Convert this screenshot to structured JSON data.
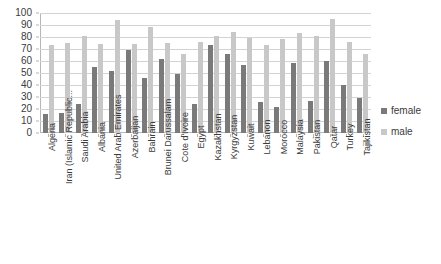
{
  "chart_data": {
    "type": "bar",
    "title": "",
    "subtitle": "",
    "xlabel": "",
    "ylabel": "",
    "ylim": [
      0,
      100
    ],
    "ytick_step": 10,
    "yticks": [
      100,
      90,
      80,
      70,
      60,
      50,
      40,
      30,
      20,
      10,
      0
    ],
    "grid": true,
    "legend_position": "right",
    "categories": [
      "Algeria",
      "Iran (Islamic Republic...",
      "Saudi Arabia",
      "Albania",
      "United Arab Emirates",
      "Azerbaijan",
      "Bahrain",
      "Brunei Darussalam",
      "Cote d'Ivoire",
      "Egypt",
      "Kazakhstan",
      "Kyrgyzstan",
      "Kuwait",
      "Lebanon",
      "Morocco",
      "Malaysia",
      "Pakistan",
      "Qatar",
      "Turkey",
      "Tajikistan"
    ],
    "series": [
      {
        "name": "female",
        "color": "#7a7a7a",
        "values": [
          16,
          17,
          24,
          55,
          52,
          69,
          46,
          62,
          49,
          24,
          73,
          66,
          57,
          26,
          22,
          58,
          27,
          60,
          40,
          29
        ]
      },
      {
        "name": "male",
        "color": "#c8c8c8",
        "values": [
          73,
          75,
          81,
          74,
          94,
          74,
          88,
          75,
          66,
          76,
          81,
          84,
          79,
          73,
          78,
          83,
          81,
          95,
          76,
          66
        ]
      }
    ]
  },
  "legend": {
    "items": [
      {
        "label": "female",
        "color": "#7a7a7a"
      },
      {
        "label": "male",
        "color": "#c8c8c8"
      }
    ]
  },
  "colors": {
    "female": "#7a7a7a",
    "male": "#c8c8c8",
    "gridline": "#d3d3d3",
    "axis": "#b6b6b6",
    "text": "#3b3b3b",
    "background": "#ffffff"
  }
}
